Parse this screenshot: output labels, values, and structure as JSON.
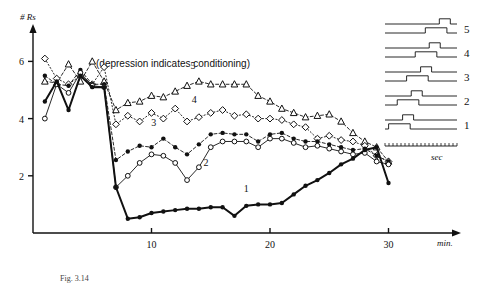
{
  "figure": {
    "title": "(depression indicates conditioning)",
    "y_axis_label": "# Rs",
    "x_axis_label": "min.",
    "caption": "Fig. 3.14"
  },
  "chart_data": {
    "type": "line",
    "title": "(depression indicates conditioning)",
    "xlabel": "min.",
    "ylabel": "# Rs",
    "xlim": [
      0,
      32
    ],
    "ylim": [
      0,
      7
    ],
    "xticks": [
      10,
      20,
      30
    ],
    "yticks": [
      2,
      4,
      6
    ],
    "grid": false,
    "legend_position": "inline",
    "series": [
      {
        "name": "1",
        "label": "1",
        "marker": "filled-circle",
        "line": "solid-thick",
        "x": [
          1,
          2,
          3,
          4,
          5,
          6,
          7,
          8,
          9,
          10,
          11,
          12,
          13,
          14,
          15,
          16,
          17,
          18,
          19,
          20,
          21,
          22,
          23,
          24,
          25,
          26,
          27,
          28,
          29,
          30
        ],
        "y": [
          4.6,
          5.3,
          4.3,
          5.5,
          5.1,
          5.1,
          1.6,
          0.5,
          0.55,
          0.7,
          0.75,
          0.8,
          0.85,
          0.85,
          0.9,
          0.9,
          0.6,
          0.95,
          1.0,
          1.0,
          1.05,
          1.35,
          1.65,
          1.85,
          2.1,
          2.4,
          2.6,
          2.9,
          3.0,
          1.75
        ]
      },
      {
        "name": "2",
        "label": "2",
        "marker": "open-circle",
        "line": "solid-thin",
        "x": [
          1,
          2,
          3,
          4,
          5,
          6,
          7,
          8,
          9,
          10,
          11,
          12,
          13,
          14,
          15,
          16,
          17,
          18,
          19,
          20,
          21,
          22,
          23,
          24,
          25,
          26,
          27,
          28,
          29,
          30
        ],
        "y": [
          4.0,
          5.2,
          4.9,
          5.6,
          5.15,
          5.1,
          1.6,
          2.0,
          2.45,
          2.75,
          2.7,
          2.45,
          1.85,
          2.3,
          3.0,
          3.2,
          3.2,
          3.2,
          3.0,
          3.3,
          3.3,
          3.15,
          3.0,
          3.05,
          2.95,
          2.85,
          2.75,
          2.8,
          2.5,
          2.4
        ]
      },
      {
        "name": "3",
        "label": "3",
        "marker": "filled-circle",
        "line": "dashed",
        "x": [
          1,
          2,
          3,
          4,
          5,
          6,
          7,
          8,
          9,
          10,
          11,
          12,
          13,
          14,
          15,
          16,
          17,
          18,
          19,
          20,
          21,
          22,
          23,
          24,
          25,
          26,
          27,
          28,
          29,
          30
        ],
        "y": [
          5.5,
          5.2,
          5.15,
          5.7,
          5.2,
          5.2,
          2.55,
          2.85,
          3.05,
          3.0,
          3.3,
          3.0,
          2.75,
          3.1,
          3.45,
          3.5,
          3.45,
          3.45,
          3.2,
          3.45,
          3.5,
          3.3,
          3.2,
          3.2,
          3.1,
          3.0,
          2.9,
          2.95,
          2.7,
          2.5
        ]
      },
      {
        "name": "4",
        "label": "4",
        "marker": "open-diamond",
        "line": "dotted",
        "x": [
          1,
          2,
          3,
          4,
          5,
          6,
          7,
          8,
          9,
          10,
          11,
          12,
          13,
          14,
          15,
          16,
          17,
          18,
          19,
          20,
          21,
          22,
          23,
          24,
          25,
          26,
          27,
          28,
          29,
          30
        ],
        "y": [
          6.1,
          5.4,
          5.2,
          5.5,
          5.2,
          5.8,
          3.8,
          4.1,
          3.9,
          4.2,
          4.0,
          4.35,
          3.9,
          4.05,
          4.2,
          4.3,
          4.1,
          4.15,
          4.0,
          4.0,
          3.95,
          3.8,
          3.7,
          3.3,
          3.4,
          3.25,
          3.2,
          3.05,
          2.7,
          2.5
        ]
      },
      {
        "name": "5",
        "label": "5",
        "marker": "open-triangle",
        "line": "dashed",
        "x": [
          1,
          2,
          3,
          4,
          5,
          6,
          7,
          8,
          9,
          10,
          11,
          12,
          13,
          14,
          15,
          16,
          17,
          18,
          19,
          20,
          21,
          22,
          23,
          24,
          25,
          26,
          27,
          28,
          29,
          30
        ],
        "y": [
          5.3,
          5.25,
          5.9,
          5.3,
          6.0,
          5.3,
          4.3,
          4.55,
          4.6,
          4.8,
          4.75,
          4.95,
          5.15,
          5.3,
          5.2,
          5.2,
          5.2,
          5.2,
          4.8,
          4.6,
          4.35,
          4.2,
          4.05,
          4.1,
          4.15,
          3.9,
          3.5,
          3.2,
          3.0,
          2.5
        ]
      }
    ]
  },
  "legend": {
    "rows": [
      {
        "number": "5",
        "pulse_start": 0.56,
        "pulse_width": 0.3
      },
      {
        "number": "4",
        "pulse_start": 0.42,
        "pulse_width": 0.3
      },
      {
        "number": "3",
        "pulse_start": 0.3,
        "pulse_width": 0.3
      },
      {
        "number": "2",
        "pulse_start": 0.17,
        "pulse_width": 0.3
      },
      {
        "number": "1",
        "pulse_start": 0.05,
        "pulse_width": 0.3
      }
    ],
    "time_unit": "sec"
  }
}
